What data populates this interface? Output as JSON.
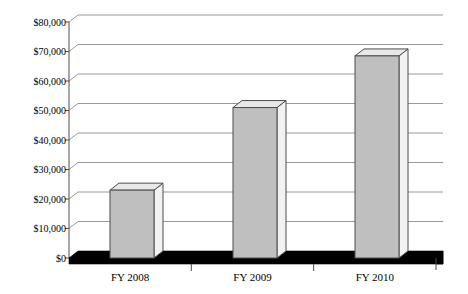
{
  "chart_data": {
    "type": "bar",
    "title": "",
    "subtitle": "",
    "xlabel": "",
    "ylabel": "",
    "categories": [
      "FY 2008",
      "FY 2009",
      "FY 2010"
    ],
    "values": [
      23000,
      51000,
      68500
    ],
    "value_labels": [
      "$23,000",
      "$51,000",
      "$68,500"
    ],
    "ylim": [
      0,
      80000
    ],
    "ytick_values": [
      0,
      10000,
      20000,
      30000,
      40000,
      50000,
      60000,
      70000,
      80000
    ],
    "ytick_labels": [
      "$0",
      "$10,000",
      "$20,000",
      "$30,000",
      "$40,000",
      "$50,000",
      "$60,000",
      "$70,000",
      "$80,000"
    ],
    "grid": true,
    "legend": false,
    "legend_position": "none",
    "series": [
      {
        "name": "Amount",
        "values": [
          23000,
          51000,
          68500
        ]
      }
    ],
    "style": {
      "three_d": true,
      "bar_front_color": "#bfbfbf",
      "bar_top_color": "#e8e8e8",
      "bar_side_color": "#f2f2f2",
      "bar_outline_color": "#4d4d4d",
      "gridline_color": "#9a9a9a",
      "axis_color": "#4d4d4d",
      "floor_color": "#000000",
      "background_color": "#ffffff",
      "text_color": "#000000"
    }
  }
}
